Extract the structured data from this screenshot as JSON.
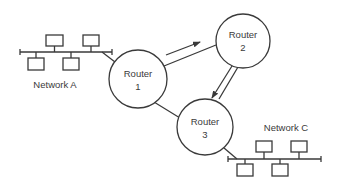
{
  "diagram": {
    "type": "network-topology",
    "line_color": "#3a3a3a",
    "background": "#ffffff",
    "routers": [
      {
        "id": "router-1",
        "line1": "Router",
        "line2": "1"
      },
      {
        "id": "router-2",
        "line1": "Router",
        "line2": "2"
      },
      {
        "id": "router-3",
        "line1": "Router",
        "line2": "3"
      }
    ],
    "networks": [
      {
        "id": "network-a",
        "label": "Network A",
        "hosts": 4
      },
      {
        "id": "network-c",
        "label": "Network C",
        "hosts": 4
      }
    ],
    "links": [
      {
        "from": "network-a",
        "to": "router-1"
      },
      {
        "from": "router-1",
        "to": "router-2"
      },
      {
        "from": "router-2",
        "to": "router-3"
      },
      {
        "from": "router-1",
        "to": "router-3"
      },
      {
        "from": "router-3",
        "to": "network-c"
      }
    ],
    "flow_arrows": [
      {
        "from": "router-1",
        "to": "router-2"
      },
      {
        "from": "router-2",
        "to": "router-3"
      }
    ]
  }
}
